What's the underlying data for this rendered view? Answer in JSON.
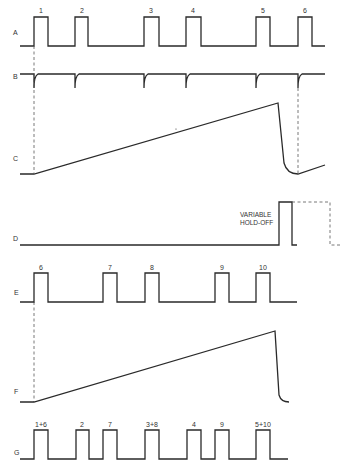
{
  "diagram": {
    "traces": [
      {
        "id": "A",
        "label": "A",
        "pulse_labels": [
          "1",
          "2",
          "3",
          "4",
          "5",
          "6"
        ]
      },
      {
        "id": "B",
        "label": "B"
      },
      {
        "id": "C",
        "label": "C"
      },
      {
        "id": "D",
        "label": "D",
        "annotation_line1": "VARIABLE",
        "annotation_line2": "HOLD-OFF"
      },
      {
        "id": "E",
        "label": "E",
        "pulse_labels": [
          "6",
          "7",
          "8",
          "9",
          "10"
        ]
      },
      {
        "id": "F",
        "label": "F"
      },
      {
        "id": "G",
        "label": "G",
        "pulse_labels": [
          "1+6",
          "2",
          "7",
          "3+8",
          "4",
          "9",
          "5+10"
        ]
      }
    ],
    "colors": {
      "line": "#2a2a2a",
      "background": "#ffffff"
    }
  }
}
